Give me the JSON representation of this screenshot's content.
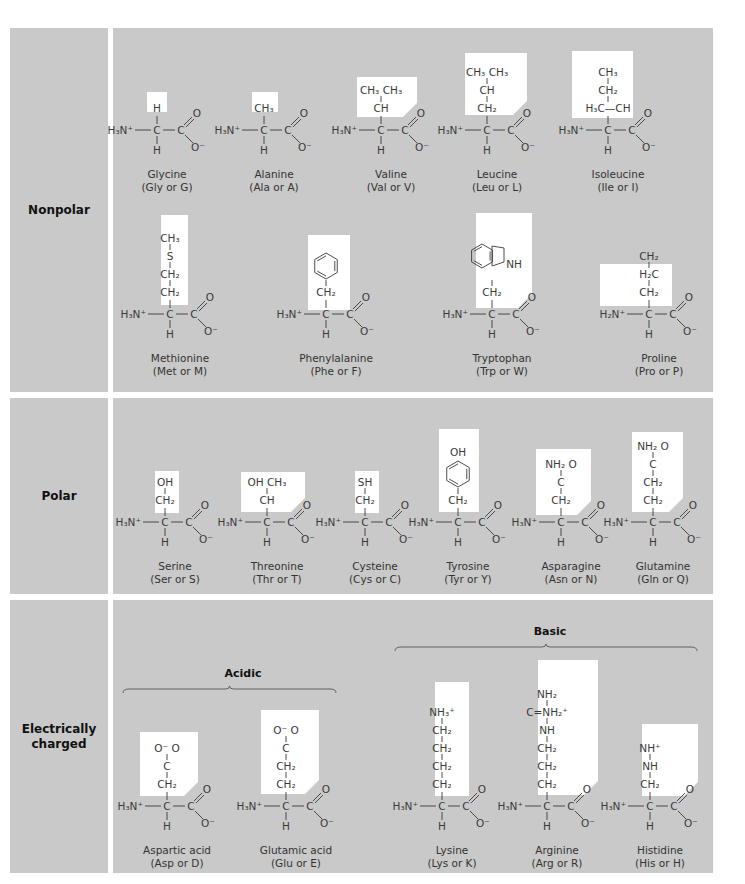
{
  "colors": {
    "panel": "#c9c9c9",
    "sidechain_box": "#ffffff",
    "ink": "#3a3a3a",
    "label": "#111111"
  },
  "categories": [
    {
      "id": "nonpolar",
      "label": "Nonpolar"
    },
    {
      "id": "polar",
      "label": "Polar"
    },
    {
      "id": "charged",
      "label": "Electrically charged"
    }
  ],
  "subgroups": [
    {
      "id": "acidic",
      "label": "Acidic"
    },
    {
      "id": "basic",
      "label": "Basic"
    }
  ],
  "amino_acids": [
    {
      "name": "Glycine",
      "abbr": "(Gly or G)",
      "category": "nonpolar",
      "side_chain": [
        "H"
      ]
    },
    {
      "name": "Alanine",
      "abbr": "(Ala or A)",
      "category": "nonpolar",
      "side_chain": [
        "CH₃"
      ]
    },
    {
      "name": "Valine",
      "abbr": "(Val or V)",
      "category": "nonpolar",
      "side_chain": [
        "CH₃ CH₃",
        "CH"
      ]
    },
    {
      "name": "Leucine",
      "abbr": "(Leu or L)",
      "category": "nonpolar",
      "side_chain": [
        "CH₃ CH₃",
        "CH",
        "CH₂"
      ]
    },
    {
      "name": "Isoleucine",
      "abbr": "(Ile or I)",
      "category": "nonpolar",
      "side_chain": [
        "CH₃",
        "CH₂",
        "H₃C—CH"
      ]
    },
    {
      "name": "Methionine",
      "abbr": "(Met or M)",
      "category": "nonpolar",
      "side_chain": [
        "CH₃",
        "S",
        "CH₂",
        "CH₂"
      ]
    },
    {
      "name": "Phenylalanine",
      "abbr": "(Phe or F)",
      "category": "nonpolar",
      "side_chain": [
        "benzene-ring",
        "CH₂"
      ]
    },
    {
      "name": "Tryptophan",
      "abbr": "(Trp or W)",
      "category": "nonpolar",
      "side_chain": [
        "indole-ring",
        "NH",
        "CH₂"
      ]
    },
    {
      "name": "Proline",
      "abbr": "(Pro or P)",
      "category": "nonpolar",
      "side_chain": [
        "CH₂",
        "H₂C",
        "CH₂"
      ],
      "amine": "H₂N⁺"
    },
    {
      "name": "Serine",
      "abbr": "(Ser or S)",
      "category": "polar",
      "side_chain": [
        "OH",
        "CH₂"
      ]
    },
    {
      "name": "Threonine",
      "abbr": "(Thr or T)",
      "category": "polar",
      "side_chain": [
        "OH CH₃",
        "CH"
      ]
    },
    {
      "name": "Cysteine",
      "abbr": "(Cys or C)",
      "category": "polar",
      "side_chain": [
        "SH",
        "CH₂"
      ]
    },
    {
      "name": "Tyrosine",
      "abbr": "(Tyr or Y)",
      "category": "polar",
      "side_chain": [
        "OH",
        "benzene-ring",
        "CH₂"
      ]
    },
    {
      "name": "Asparagine",
      "abbr": "(Asn or N)",
      "category": "polar",
      "side_chain": [
        "NH₂ O",
        "C",
        "CH₂"
      ]
    },
    {
      "name": "Glutamine",
      "abbr": "(Gln or Q)",
      "category": "polar",
      "side_chain": [
        "NH₂ O",
        "C",
        "CH₂",
        "CH₂"
      ]
    },
    {
      "name": "Aspartic acid",
      "abbr": "(Asp or D)",
      "category": "charged",
      "subgroup": "acidic",
      "side_chain": [
        "O⁻ O",
        "C",
        "CH₂"
      ]
    },
    {
      "name": "Glutamic acid",
      "abbr": "(Glu or E)",
      "category": "charged",
      "subgroup": "acidic",
      "side_chain": [
        "O⁻ O",
        "C",
        "CH₂",
        "CH₂"
      ]
    },
    {
      "name": "Lysine",
      "abbr": "(Lys or K)",
      "category": "charged",
      "subgroup": "basic",
      "side_chain": [
        "NH₃⁺",
        "CH₂",
        "CH₂",
        "CH₂",
        "CH₂"
      ]
    },
    {
      "name": "Arginine",
      "abbr": "(Arg or R)",
      "category": "charged",
      "subgroup": "basic",
      "side_chain": [
        "NH₂",
        "C=NH₂⁺",
        "NH",
        "CH₂",
        "CH₂",
        "CH₂"
      ]
    },
    {
      "name": "Histidine",
      "abbr": "(His or H)",
      "category": "charged",
      "subgroup": "basic",
      "side_chain": [
        "NH⁺",
        "NH",
        "CH₂"
      ]
    }
  ],
  "backbone": {
    "amine": "H₃N⁺",
    "alpha": "C",
    "carboxyl": "C",
    "carbonyl_o": "O",
    "oxide": "O⁻",
    "alpha_h": "H"
  }
}
